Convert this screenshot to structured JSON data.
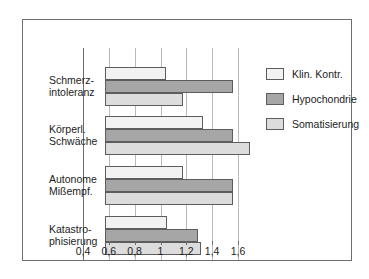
{
  "chart_data": {
    "type": "bar",
    "orientation": "horizontal",
    "title": "",
    "xlabel": "",
    "ylabel": "",
    "xlim": [
      0.4,
      1.6
    ],
    "xticks": [
      0.4,
      0.6,
      0.8,
      1.0,
      1.2,
      1.4,
      1.6
    ],
    "xtick_labels": [
      "0,4",
      "0,6",
      "0,8",
      "1",
      "1,2",
      "1,4",
      "1,6"
    ],
    "grid": "vertical",
    "legend_position": "right",
    "categories": [
      "Schmerz-\nintoleranz",
      "Körperl.\nSchwäche",
      "Autonome\nMißempf.",
      "Katastro-\nphisierung"
    ],
    "category_lines": [
      [
        "Schmerz-",
        "intoleranz"
      ],
      [
        "Körperl.",
        "Schwäche"
      ],
      [
        "Autonome",
        "Mißempf."
      ],
      [
        "Katastro-",
        "phisierung"
      ]
    ],
    "series": [
      {
        "name": "Klin. Kontr.",
        "color": "#f2f2f2",
        "values": [
          0.87,
          1.16,
          1.0,
          0.88
        ]
      },
      {
        "name": "Hypochondrie",
        "color": "#a6a6a6",
        "values": [
          1.39,
          1.39,
          1.39,
          1.12
        ]
      },
      {
        "name": "Somatisierung",
        "color": "#dcdcdc",
        "values": [
          1.0,
          1.52,
          1.39,
          1.14
        ]
      }
    ]
  },
  "legend": {
    "items": [
      {
        "label": "Klin. Kontr."
      },
      {
        "label": "Hypochondrie"
      },
      {
        "label": "Somatisierung"
      }
    ]
  }
}
